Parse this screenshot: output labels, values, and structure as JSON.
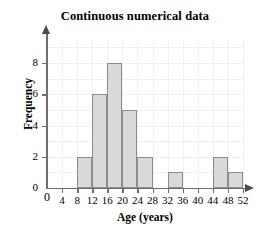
{
  "chart_data": {
    "type": "bar",
    "title": "Continuous numerical data",
    "xlabel": "Age (years)",
    "ylabel": "Frequency",
    "xlim": [
      0,
      52
    ],
    "ylim": [
      0,
      9
    ],
    "grid": true,
    "legend": null,
    "bin_width": 4,
    "categories": [
      "8-12",
      "12-16",
      "16-20",
      "20-24",
      "24-28",
      "28-32",
      "32-36",
      "36-40",
      "40-44",
      "44-48",
      "48-52"
    ],
    "bin_edges": [
      8,
      12,
      16,
      20,
      24,
      28,
      32,
      36,
      40,
      44,
      48,
      52
    ],
    "values": [
      2,
      6,
      8,
      5,
      2,
      0,
      1,
      0,
      0,
      2,
      1
    ],
    "bars": [
      {
        "start": 8,
        "end": 12,
        "value": 2
      },
      {
        "start": 12,
        "end": 16,
        "value": 6
      },
      {
        "start": 16,
        "end": 20,
        "value": 8
      },
      {
        "start": 20,
        "end": 24,
        "value": 5
      },
      {
        "start": 24,
        "end": 28,
        "value": 2
      },
      {
        "start": 28,
        "end": 32,
        "value": 0
      },
      {
        "start": 32,
        "end": 36,
        "value": 1
      },
      {
        "start": 36,
        "end": 40,
        "value": 0
      },
      {
        "start": 40,
        "end": 44,
        "value": 0
      },
      {
        "start": 44,
        "end": 48,
        "value": 2
      },
      {
        "start": 48,
        "end": 52,
        "value": 1
      }
    ],
    "x_ticks": [
      0,
      4,
      8,
      12,
      16,
      20,
      24,
      28,
      32,
      36,
      40,
      44,
      48,
      52
    ],
    "x_tick_labels": [
      "0",
      "4",
      "8",
      "12",
      "16",
      "20",
      "24",
      "28",
      "32",
      "36",
      "40",
      "44",
      "48",
      "52"
    ],
    "y_ticks": [
      0,
      2,
      4,
      6,
      8
    ],
    "y_tick_labels": [
      "0",
      "2",
      "4",
      "6",
      "8"
    ],
    "colors": {
      "bar_fill": "#d9d9d9",
      "bar_edge": "#8c8c8c",
      "axis": "#6e6e6e",
      "grid": "#f0f0f0",
      "text": "#000000",
      "background": "#ffffff"
    }
  }
}
